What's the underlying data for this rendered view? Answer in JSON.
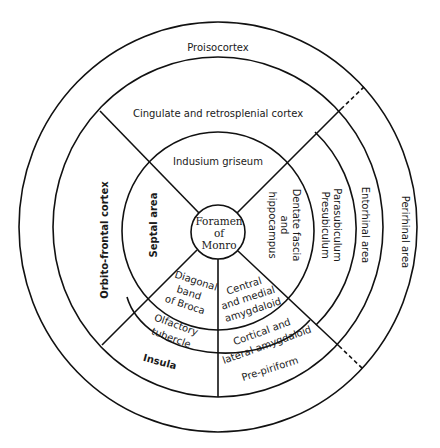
{
  "diagram": {
    "center": {
      "label_lines": [
        "Foramen",
        "of",
        "Monro"
      ]
    },
    "outer_ring": {
      "proisocortex": "Proisocortex",
      "orbito_frontal": "Orbito-frontal cortex",
      "perirhinal": "Perirhinal area"
    },
    "middle_ring": {
      "cingulate": "Cingulate and retrosplenial cortex",
      "entorhinal": "Entorhinal area",
      "parasubiculum": "Parasubiculum",
      "presubiculum": "Presubiculum",
      "insula": "Insula",
      "pre_piriform": "Pre-piriform"
    },
    "inner_ring": {
      "indusium": "Indusium griseum",
      "septal": "Septal area",
      "dentate": [
        "Dentate fascia",
        "and",
        "hippocampus"
      ],
      "diagonal": [
        "Diagonal",
        "band",
        "of Broca"
      ],
      "olfactory": [
        "Olfactory",
        "tubercle"
      ],
      "central_medial": [
        "Central",
        "and medial",
        "amygdaloid"
      ],
      "cortical_lateral": [
        "Cortical and",
        "lateral amygdaloid"
      ]
    },
    "colors": {
      "line": "#111111",
      "text": "#1a1a1a",
      "background": "#ffffff"
    }
  }
}
